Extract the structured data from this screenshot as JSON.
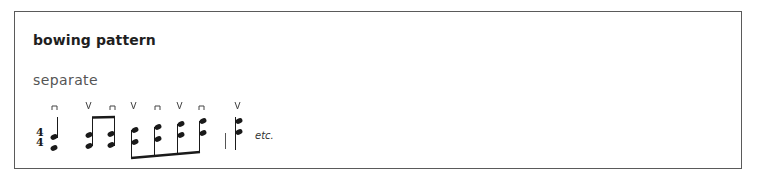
{
  "panel": {
    "title": "bowing pattern",
    "subtitle": "separate",
    "notation": {
      "time_signature": {
        "top": "4",
        "bottom": "4"
      },
      "bowing_marks": [
        "down-bow",
        "up-bow",
        "down-bow",
        "up-bow",
        "down-bow",
        "up-bow",
        "down-bow",
        "up-bow"
      ],
      "groups": [
        {
          "type": "quarter",
          "stem": "up",
          "bowing": "down-bow"
        },
        {
          "type": "beamed-eighths",
          "count": 2,
          "stem": "up",
          "bowing": [
            "up-bow",
            "down-bow"
          ]
        },
        {
          "type": "beamed-eighths",
          "count": 4,
          "stem": "down",
          "bowing": [
            "up-bow",
            "down-bow",
            "up-bow",
            "down-bow"
          ]
        },
        {
          "type": "barline"
        },
        {
          "type": "note",
          "stem": "up",
          "bowing": "up-bow"
        }
      ],
      "continuation": "etc."
    },
    "colors": {
      "ink": "#1a1a1a",
      "border": "#5a5a5a",
      "title": "#1f1f1f",
      "subtitle": "#555555"
    }
  }
}
